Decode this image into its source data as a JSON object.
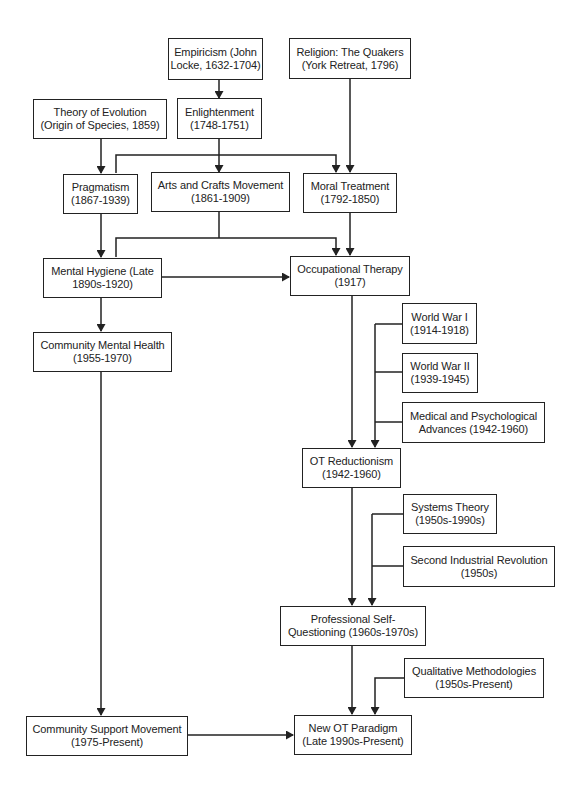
{
  "diagram": {
    "type": "flowchart",
    "colors": {
      "line": "#222222",
      "text": "#222222",
      "box_fill": "#ffffff",
      "background": "#ffffff"
    },
    "nodes": [
      {
        "id": "empiricism",
        "line1": "Empiricism (John",
        "line2": "Locke, 1632-1704)"
      },
      {
        "id": "religion",
        "line1": "Religion: The Quakers",
        "line2": "(York Retreat, 1796)"
      },
      {
        "id": "evolution",
        "line1": "Theory of Evolution",
        "line2": "(Origin of Species, 1859)"
      },
      {
        "id": "enlightenment",
        "line1": "Enlightenment",
        "line2": "(1748-1751)"
      },
      {
        "id": "pragmatism",
        "line1": "Pragmatism",
        "line2": "(1867-1939)"
      },
      {
        "id": "arts_crafts",
        "line1": "Arts and Crafts Movement",
        "line2": "(1861-1909)"
      },
      {
        "id": "moral_treatment",
        "line1": "Moral Treatment",
        "line2": "(1792-1850)"
      },
      {
        "id": "mental_hygiene",
        "line1": "Mental Hygiene (Late",
        "line2": "1890s-1920)"
      },
      {
        "id": "occupational_therapy",
        "line1": "Occupational Therapy",
        "line2": "(1917)"
      },
      {
        "id": "community_mental_health",
        "line1": "Community Mental Health",
        "line2": "(1955-1970)"
      },
      {
        "id": "ww1",
        "line1": "World War I",
        "line2": "(1914-1918)"
      },
      {
        "id": "ww2",
        "line1": "World War II",
        "line2": "(1939-1945)"
      },
      {
        "id": "med_psych",
        "line1": "Medical and Psychological",
        "line2": "Advances (1942-1960)"
      },
      {
        "id": "ot_reductionism",
        "line1": "OT Reductionism",
        "line2": "(1942-1960)"
      },
      {
        "id": "systems_theory",
        "line1": "Systems Theory",
        "line2": "(1950s-1990s)"
      },
      {
        "id": "second_industrial",
        "line1": "Second Industrial Revolution",
        "line2": "(1950s)"
      },
      {
        "id": "professional_self_questioning",
        "line1": "Professional Self-",
        "line2": "Questioning (1960s-1970s)"
      },
      {
        "id": "qualitative_methodologies",
        "line1": "Qualitative Methodologies",
        "line2": "(1950s-Present)"
      },
      {
        "id": "community_support",
        "line1": "Community Support Movement",
        "line2": "(1975-Present)"
      },
      {
        "id": "new_ot_paradigm",
        "line1": "New OT Paradigm",
        "line2": "(Late 1990s-Present)"
      }
    ],
    "edges": [
      {
        "from": "empiricism",
        "to": "enlightenment"
      },
      {
        "from": "evolution",
        "to": "pragmatism"
      },
      {
        "from": "enlightenment",
        "to": "pragmatism"
      },
      {
        "from": "enlightenment",
        "to": "arts_crafts"
      },
      {
        "from": "enlightenment",
        "to": "moral_treatment"
      },
      {
        "from": "religion",
        "to": "moral_treatment"
      },
      {
        "from": "pragmatism",
        "to": "mental_hygiene"
      },
      {
        "from": "arts_crafts",
        "to": "mental_hygiene"
      },
      {
        "from": "arts_crafts",
        "to": "occupational_therapy"
      },
      {
        "from": "moral_treatment",
        "to": "occupational_therapy"
      },
      {
        "from": "mental_hygiene",
        "to": "occupational_therapy"
      },
      {
        "from": "mental_hygiene",
        "to": "community_mental_health"
      },
      {
        "from": "occupational_therapy",
        "to": "ot_reductionism"
      },
      {
        "from": "ww1",
        "to": "ot_reductionism"
      },
      {
        "from": "ww2",
        "to": "ot_reductionism"
      },
      {
        "from": "med_psych",
        "to": "ot_reductionism"
      },
      {
        "from": "ot_reductionism",
        "to": "professional_self_questioning"
      },
      {
        "from": "systems_theory",
        "to": "professional_self_questioning"
      },
      {
        "from": "second_industrial",
        "to": "professional_self_questioning"
      },
      {
        "from": "professional_self_questioning",
        "to": "new_ot_paradigm"
      },
      {
        "from": "qualitative_methodologies",
        "to": "new_ot_paradigm"
      },
      {
        "from": "community_mental_health",
        "to": "community_support"
      },
      {
        "from": "community_support",
        "to": "new_ot_paradigm"
      }
    ]
  }
}
